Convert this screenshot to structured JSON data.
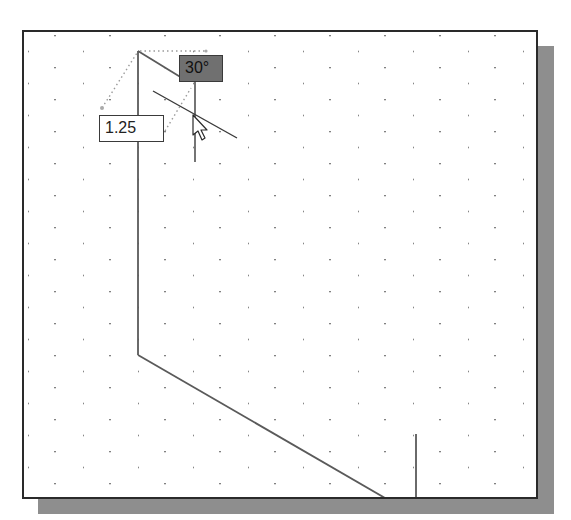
{
  "drawing": {
    "frame": {
      "border_color": "#2a2a2a",
      "shadow_color": "#8e8e8e",
      "background": "#ffffff"
    },
    "grid": {
      "dot_color": "#7a7a7a",
      "spacing_x": 55,
      "spacing_y": 16,
      "row_offset": 27
    },
    "line_color": "#5a5a5a",
    "dynamic_input": {
      "length_value": "1.25",
      "angle_value": "30°"
    },
    "cursor": {
      "icon": "arrow-pointer-icon"
    }
  }
}
